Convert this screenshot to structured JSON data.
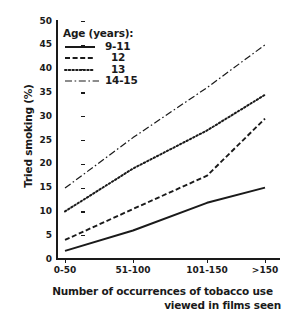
{
  "chart_data": {
    "type": "line",
    "title": "",
    "xlabel": "Number of occurrences of tobacco use viewed in films seen",
    "xlabel_line1": "Number of occurrences of tobacco use",
    "xlabel_line2": "viewed in films seen",
    "ylabel": "Tried smoking (%)",
    "categories": [
      "0-50",
      "51-100",
      "101-150",
      ">150"
    ],
    "ylim": [
      0,
      50
    ],
    "yticks": [
      0,
      5,
      10,
      15,
      20,
      25,
      30,
      35,
      40,
      45,
      50
    ],
    "grid": false,
    "legend_position": "upper-left",
    "legend_title": "Age (years):",
    "series": [
      {
        "name": "9-11",
        "style": "solid",
        "values": [
          1.7,
          6.0,
          11.8,
          15.0
        ]
      },
      {
        "name": "12",
        "style": "dashed",
        "values": [
          4.0,
          10.5,
          17.5,
          29.5
        ]
      },
      {
        "name": "13",
        "style": "dotted",
        "values": [
          10.0,
          19.0,
          27.0,
          34.5
        ]
      },
      {
        "name": "14-15",
        "style": "dash-dot",
        "values": [
          14.9,
          25.5,
          36.0,
          45.0
        ]
      }
    ]
  },
  "colors": {
    "ink": "#1a1a1a",
    "background": "#ffffff"
  }
}
